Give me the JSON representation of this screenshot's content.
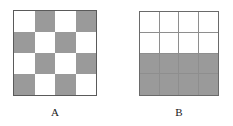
{
  "figure": {
    "background_color": "#ffffff",
    "shaded_color": "#9a9a9a",
    "unshaded_color": "#ffffff",
    "border_color": "#5a5a5a",
    "gridline_color": "#8e8e8e",
    "panels": [
      {
        "id": "A",
        "caption": "A",
        "rows": 4,
        "columns": 4,
        "pattern_name": "checkerboard",
        "shaded_count": 8,
        "unshaded_count": 8,
        "shaded_fraction": "1/2",
        "gridlines_visible": false,
        "cells": [
          [
            "light",
            "dark",
            "light",
            "dark"
          ],
          [
            "dark",
            "light",
            "dark",
            "light"
          ],
          [
            "light",
            "dark",
            "light",
            "dark"
          ],
          [
            "dark",
            "light",
            "dark",
            "light"
          ]
        ]
      },
      {
        "id": "B",
        "caption": "B",
        "rows": 4,
        "columns": 4,
        "pattern_name": "bottom-half-shaded",
        "shaded_count": 8,
        "unshaded_count": 8,
        "shaded_fraction": "1/2",
        "gridlines_visible": true,
        "cells": [
          [
            "light",
            "light",
            "light",
            "light"
          ],
          [
            "light",
            "light",
            "light",
            "light"
          ],
          [
            "dark",
            "dark",
            "dark",
            "dark"
          ],
          [
            "dark",
            "dark",
            "dark",
            "dark"
          ]
        ]
      }
    ]
  }
}
